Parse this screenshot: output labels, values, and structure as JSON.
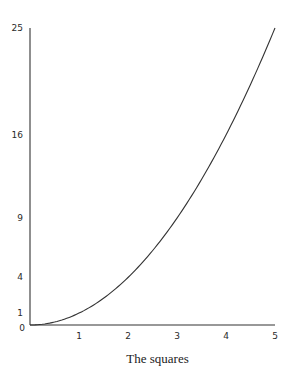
{
  "chart_data": {
    "type": "line",
    "title": "The squares",
    "xlabel": "",
    "ylabel": "",
    "x": [
      0,
      0.5,
      1,
      1.5,
      2,
      2.5,
      3,
      3.5,
      4,
      4.5,
      5
    ],
    "series": [
      {
        "name": "y = x²",
        "values": [
          0,
          0.25,
          1,
          2.25,
          4,
          6.25,
          9,
          12.25,
          16,
          20.25,
          25
        ]
      }
    ],
    "xticks": [
      0,
      1,
      2,
      3,
      4,
      5
    ],
    "xtick_labels": [
      "0",
      "1",
      "2",
      "3",
      "4",
      "5"
    ],
    "yticks": [
      1,
      4,
      9,
      16,
      25
    ],
    "ytick_labels": [
      "1",
      "4",
      "9",
      "16",
      "25"
    ],
    "xlim": [
      0,
      5
    ],
    "ylim": [
      0,
      25
    ],
    "grid": false,
    "legend": false
  },
  "caption": "The squares",
  "colors": {
    "line": "#333333",
    "axis": "#333333"
  }
}
